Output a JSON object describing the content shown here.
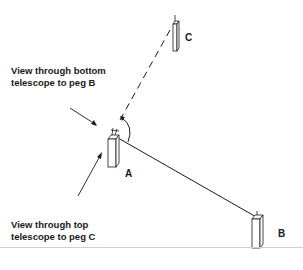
{
  "labels": {
    "bottom_view": [
      "View through bottom",
      "telescope to peg B"
    ],
    "top_view": [
      "View through top",
      "telescope to peg C"
    ],
    "peg_a": "A",
    "peg_b": "B",
    "peg_c": "C"
  },
  "colors": {
    "ink": "#1a1a1a",
    "divider": "#cfcfcf",
    "background": "#ffffff"
  }
}
